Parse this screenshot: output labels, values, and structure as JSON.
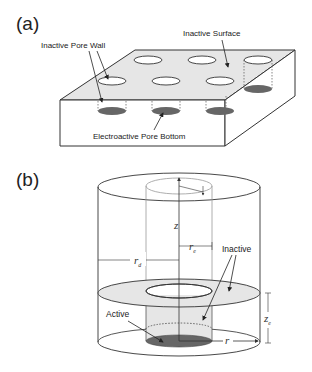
{
  "panel_a": {
    "label": "(a)",
    "annotations": {
      "inactive_surface": "Inactive Surface",
      "inactive_pore_wall": "Inactive Pore Wall",
      "electroactive_pore_bottom": "Electroactive Pore Bottom"
    },
    "pore_grid": {
      "rows": 2,
      "cols": 3
    }
  },
  "panel_b": {
    "label": "(b)",
    "annotations": {
      "inactive": "Inactive",
      "active": "Active"
    },
    "symbols": {
      "z": "z",
      "r_e": "r",
      "r_e_sub": "e",
      "r_d": "r",
      "r_d_sub": "d",
      "z_e": "z",
      "z_e_sub": "e",
      "r": "r"
    }
  },
  "colors": {
    "surface_fill": "#e6e6e6",
    "pore_bottom_fill": "#666666",
    "line": "#333333",
    "background": "#ffffff"
  }
}
